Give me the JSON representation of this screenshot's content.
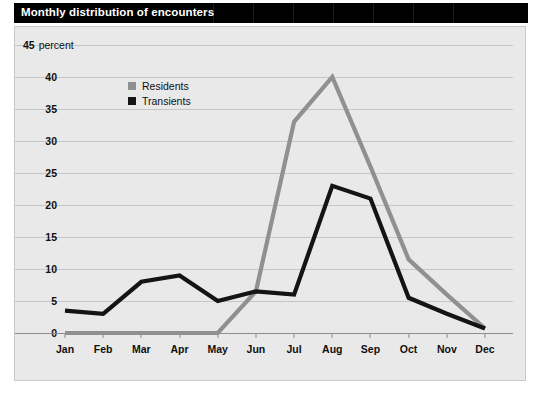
{
  "title_bar": {
    "title": "Monthly distribution of encounters",
    "background": "#000000",
    "text_color": "#ffffff"
  },
  "legend": {
    "items": [
      {
        "label": "Residents",
        "color": "#909090",
        "swatch": "gray-square-icon"
      },
      {
        "label": "Transients",
        "color": "#141414",
        "swatch": "black-square-icon"
      }
    ]
  },
  "chart_data": {
    "type": "line",
    "title": "Monthly distribution of encounters",
    "xlabel": "",
    "ylabel": "percent",
    "unit_label": "percent",
    "categories": [
      "Jan",
      "Feb",
      "Mar",
      "Apr",
      "May",
      "Jun",
      "Jul",
      "Aug",
      "Sep",
      "Oct",
      "Nov",
      "Dec"
    ],
    "ylim": [
      0,
      45
    ],
    "yticks": [
      0,
      5,
      10,
      15,
      20,
      25,
      30,
      35,
      40,
      45
    ],
    "ytick_labels": [
      "0",
      "5",
      "10",
      "15",
      "20",
      "25",
      "30",
      "35",
      "40",
      "45"
    ],
    "grid": true,
    "legend_position": "top-left-inside",
    "series": [
      {
        "name": "Residents",
        "color": "#909090",
        "values": [
          0,
          0,
          0,
          0,
          0,
          6.5,
          33,
          40,
          26,
          11.5,
          6,
          0.7
        ]
      },
      {
        "name": "Transients",
        "color": "#141414",
        "values": [
          3.5,
          3,
          8,
          9,
          5,
          6.5,
          6,
          23,
          21,
          5.5,
          3,
          0.7
        ]
      }
    ]
  }
}
